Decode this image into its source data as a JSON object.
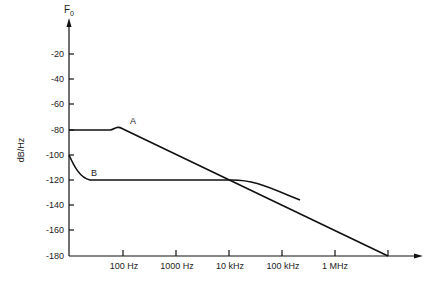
{
  "chart_data": {
    "type": "line",
    "title": "",
    "xlabel": "",
    "ylabel": "dB/Hz",
    "y_axis_top_label": "F0",
    "x_scale": "log",
    "x_tick_labels": [
      "100 Hz",
      "1000 Hz",
      "10 kHz",
      "100 kHz",
      "1 MHz"
    ],
    "y_ticks": [
      -20,
      -40,
      -60,
      -80,
      -100,
      -120,
      -140,
      -160,
      -180
    ],
    "y_tick_labels": [
      "-20",
      "-40",
      "-60",
      "-80",
      "-100",
      "-120",
      "-140",
      "-160",
      "-180"
    ],
    "ylim": [
      -180,
      0
    ],
    "xlim_hz": [
      10,
      10000000
    ],
    "grid": false,
    "series": [
      {
        "name": "A",
        "points_hz_db": [
          [
            10,
            -80
          ],
          [
            60,
            -80
          ],
          [
            80,
            -78
          ],
          [
            100,
            -79
          ],
          [
            1000,
            -99
          ],
          [
            10000,
            -119
          ],
          [
            100000,
            -140
          ],
          [
            1000000,
            -160
          ],
          [
            10000000,
            -180
          ]
        ]
      },
      {
        "name": "B",
        "points_hz_db": [
          [
            10,
            -100
          ],
          [
            20,
            -116
          ],
          [
            25,
            -120
          ],
          [
            100,
            -120
          ],
          [
            1000,
            -120
          ],
          [
            10000,
            -121
          ],
          [
            30000,
            -127
          ],
          [
            100000,
            -140
          ],
          [
            1000000,
            -160
          ],
          [
            10000000,
            -180
          ]
        ]
      }
    ]
  }
}
